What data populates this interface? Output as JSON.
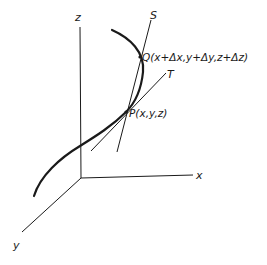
{
  "diagram": {
    "type": "3d-space-curve-secant-tangent",
    "colors": {
      "ink": "#1a1a1a",
      "background": "#ffffff"
    },
    "axes": {
      "z": {
        "label": "z"
      },
      "x": {
        "label": "x"
      },
      "y": {
        "label": "y"
      }
    },
    "lines": {
      "secant": {
        "label": "S"
      },
      "tangent": {
        "label": "T"
      }
    },
    "points": {
      "P": {
        "label": "P(x,y,z)"
      },
      "Q": {
        "label": "Q(x+Δx,y+Δy,z+Δz)"
      }
    }
  }
}
